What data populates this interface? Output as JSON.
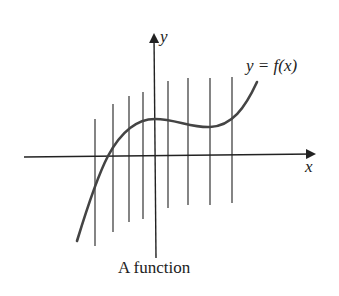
{
  "figure": {
    "caption": "A function",
    "axis_labels": {
      "x": "x",
      "y": "y"
    },
    "curve_label": "y = f(x)",
    "colors": {
      "axes": "#222222",
      "curve": "#444444",
      "vertical_lines": "#333333",
      "background": "#ffffff"
    },
    "vertical_lines": [
      {
        "x": 95,
        "top": 119,
        "bottom": 246
      },
      {
        "x": 113,
        "top": 104,
        "bottom": 232
      },
      {
        "x": 129,
        "top": 96,
        "bottom": 222
      },
      {
        "x": 143,
        "top": 92,
        "bottom": 219
      },
      {
        "x": 168,
        "top": 81,
        "bottom": 208
      },
      {
        "x": 188,
        "top": 78,
        "bottom": 205
      },
      {
        "x": 210,
        "top": 78,
        "bottom": 205
      },
      {
        "x": 232,
        "top": 77,
        "bottom": 203
      }
    ]
  }
}
